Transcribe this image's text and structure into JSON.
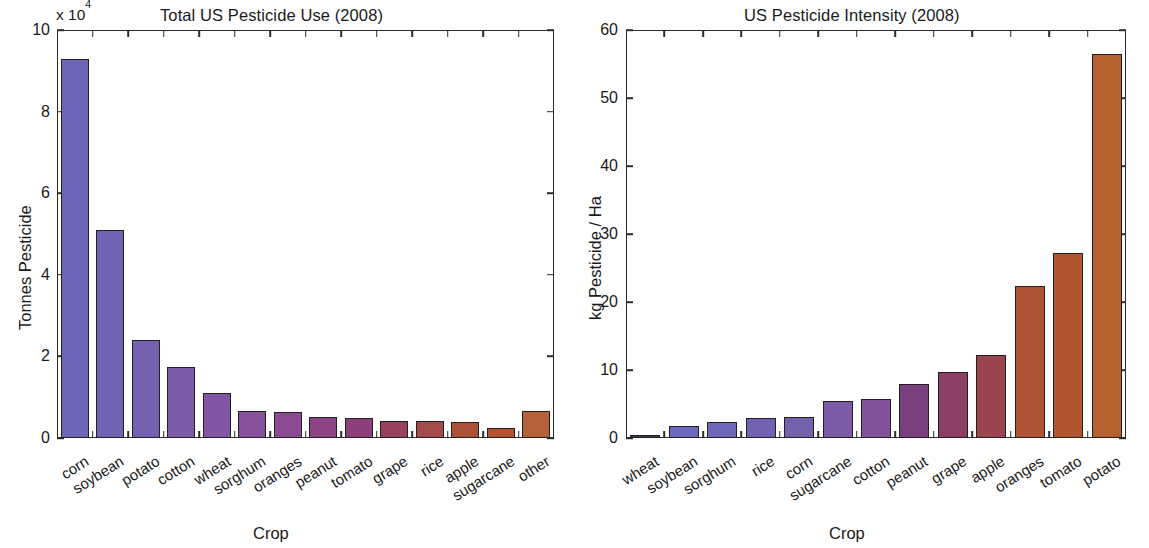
{
  "figure": {
    "background": "#ffffff",
    "axis_color": "#2b2b2b",
    "bar_edge_color": "#231f20"
  },
  "panels": [
    {
      "id": "total-use",
      "title": "Total US Pesticide Use (2008)",
      "exponent_prefix": "x 10",
      "exponent_power": "4",
      "ylabel": "Tonnes Pesticide",
      "xlabel": "Crop",
      "yticks": [
        "0",
        "2",
        "4",
        "6",
        "8",
        "10"
      ]
    },
    {
      "id": "intensity",
      "title": "US Pesticide Intensity (2008)",
      "ylabel": "kg Pesticide / Ha",
      "xlabel": "Crop",
      "yticks": [
        "0",
        "10",
        "20",
        "30",
        "40",
        "50",
        "60"
      ]
    }
  ],
  "chart_data": [
    {
      "type": "bar",
      "id": "total-use",
      "title": "Total US Pesticide Use (2008)",
      "xlabel": "Crop",
      "ylabel": "Tonnes Pesticide",
      "y_multiplier": 10000,
      "y_multiplier_text": "x 10^4",
      "ylim": [
        0,
        10
      ],
      "ytick_values": [
        0,
        2,
        4,
        6,
        8,
        10
      ],
      "grid": false,
      "legend": false,
      "categories": [
        "corn",
        "soybean",
        "potato",
        "cotton",
        "wheat",
        "sorghum",
        "oranges",
        "peanut",
        "tomato",
        "grape",
        "rice",
        "apple",
        "sugarcane",
        "other"
      ],
      "values": [
        9.3,
        5.1,
        2.4,
        1.75,
        1.1,
        0.67,
        0.63,
        0.51,
        0.48,
        0.42,
        0.41,
        0.4,
        0.24,
        0.67
      ],
      "bar_colors": [
        "#6B66B5",
        "#6E63B4",
        "#7360B0",
        "#7A5CA9",
        "#8156A2",
        "#87509A",
        "#8B4A90",
        "#8C4485",
        "#8C3F7B",
        "#98415F",
        "#A34A4A",
        "#AC5038",
        "#B2542E",
        "#B5623A"
      ]
    },
    {
      "type": "bar",
      "id": "intensity",
      "title": "US Pesticide Intensity (2008)",
      "xlabel": "Crop",
      "ylabel": "kg Pesticide / Ha",
      "ylim": [
        0,
        60
      ],
      "ytick_values": [
        0,
        10,
        20,
        30,
        40,
        50,
        60
      ],
      "grid": false,
      "legend": false,
      "categories": [
        "wheat",
        "soybean",
        "sorghum",
        "rice",
        "corn",
        "sugarcane",
        "cotton",
        "peanut",
        "grape",
        "apple",
        "oranges",
        "tomato",
        "potato"
      ],
      "values": [
        0.5,
        1.7,
        2.3,
        3.0,
        3.1,
        5.4,
        5.7,
        7.9,
        9.7,
        12.2,
        22.3,
        27.2,
        56.5
      ],
      "bar_colors": [
        "#3A3A58",
        "#6B69BA",
        "#6E66B6",
        "#7161B0",
        "#7560AC",
        "#7B5CA4",
        "#81519A",
        "#7A3F7E",
        "#8A3F63",
        "#9A4450",
        "#AD5436",
        "#B0532F",
        "#B5612F"
      ]
    }
  ]
}
